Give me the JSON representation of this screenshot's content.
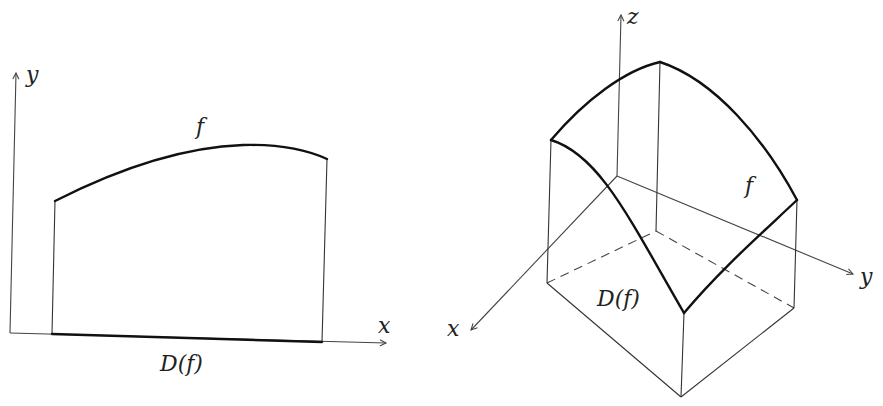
{
  "figure": {
    "left_panel": {
      "type": "2d-function-graph",
      "axes": {
        "x_label": "x",
        "y_label": "y"
      },
      "curve_label": "f",
      "domain_label": "D(f)"
    },
    "right_panel": {
      "type": "3d-surface-over-domain",
      "axes": {
        "x_label": "x",
        "y_label": "y",
        "z_label": "z"
      },
      "surface_label": "f",
      "domain_label": "D(f)"
    }
  },
  "colors": {
    "stroke": "#222222",
    "background": "#ffffff"
  }
}
